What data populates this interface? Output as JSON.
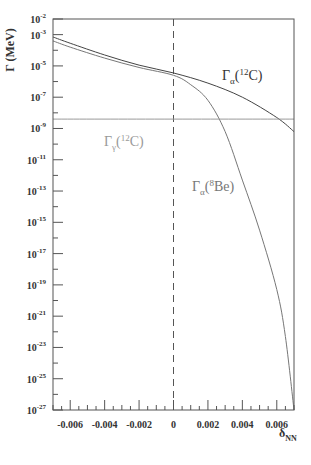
{
  "chart_data": {
    "type": "line",
    "title": "",
    "xlabel": "δ_NN",
    "ylabel": "Γ (MeV)",
    "xlim": [
      -0.007,
      0.007
    ],
    "ylim_log10": [
      -27,
      -2
    ],
    "yscale": "log",
    "grid": false,
    "x_ticks": [
      -0.006,
      -0.004,
      -0.002,
      0,
      0.002,
      0.004,
      0.006
    ],
    "x_tick_labels": [
      "-0.006",
      "-0.004",
      "-0.002",
      "0",
      "0.002",
      "0.004",
      "0.006"
    ],
    "y_ticks_log10": [
      -2,
      -3,
      -5,
      -7,
      -9,
      -11,
      -13,
      -15,
      -17,
      -19,
      -21,
      -23,
      -25,
      -27
    ],
    "y_tick_labels": [
      {
        "base": "10",
        "exp": "-2"
      },
      {
        "base": "10",
        "exp": "-3"
      },
      {
        "base": "10",
        "exp": "-5"
      },
      {
        "base": "10",
        "exp": "-7"
      },
      {
        "base": "10",
        "exp": "-9"
      },
      {
        "base": "10",
        "exp": "-11"
      },
      {
        "base": "10",
        "exp": "-13"
      },
      {
        "base": "10",
        "exp": "-15"
      },
      {
        "base": "10",
        "exp": "-17"
      },
      {
        "base": "10",
        "exp": "-19"
      },
      {
        "base": "10",
        "exp": "-21"
      },
      {
        "base": "10",
        "exp": "-23"
      },
      {
        "base": "10",
        "exp": "-25"
      },
      {
        "base": "10",
        "exp": "-27"
      }
    ],
    "vertical_reference_line": {
      "x": 0,
      "style": "dashed"
    },
    "series": [
      {
        "name": "Γα(12C)",
        "label_main": "Γ",
        "label_sub": "α",
        "label_open": "(",
        "label_sup": "12",
        "label_rest": "C)",
        "color": "#444444",
        "x": [
          -0.007,
          -0.006,
          -0.004,
          -0.002,
          0,
          0.002,
          0.004,
          0.006,
          0.007
        ],
        "log10_y": [
          -3.15,
          -3.55,
          -4.3,
          -4.95,
          -5.45,
          -6.1,
          -7.0,
          -8.3,
          -9.2
        ]
      },
      {
        "name": "Γα(8Be)",
        "label_main": "Γ",
        "label_sub": "α",
        "label_open": "(",
        "label_sup": "8",
        "label_rest": "Be)",
        "color": "#777777",
        "x": [
          -0.007,
          -0.006,
          -0.004,
          -0.002,
          0,
          0.001,
          0.002,
          0.003,
          0.004,
          0.005,
          0.006,
          0.0065,
          0.007
        ],
        "log10_y": [
          -3.4,
          -3.8,
          -4.5,
          -5.1,
          -5.6,
          -6.2,
          -7.2,
          -9.2,
          -12.3,
          -15.5,
          -19.3,
          -22.3,
          -27
        ]
      },
      {
        "name": "Γγ(12C)",
        "label_main": "Γ",
        "label_sub": "γ",
        "label_open": "(",
        "label_sup": "12",
        "label_rest": "C)",
        "color": "#999999",
        "x": [
          -0.007,
          0.007
        ],
        "log10_y": [
          -8.4,
          -8.4
        ]
      }
    ]
  }
}
